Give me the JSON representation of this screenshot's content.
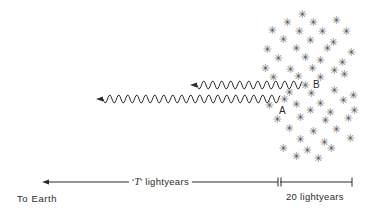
{
  "figure": {
    "type": "physics-diagram",
    "background_color": "#ffffff",
    "ink_color": "#2b2b2b",
    "star_color": "#5a5a5a",
    "width": 378,
    "height": 215
  },
  "labels": {
    "star_a": "A",
    "star_b": "B",
    "to_earth": "To Earth",
    "t_distance_prefix": "‘",
    "t_distance_symbol": "T",
    "t_distance_suffix": "’ lightyears",
    "t_distance_full": "‘T’ lightyears",
    "twenty_lightyears": "20 lightyears"
  },
  "waves": [
    {
      "name": "wave-from-b",
      "label": "B",
      "start_x": 302,
      "end_x": 190,
      "y": 85,
      "amplitude": 4.0,
      "wavelength": 9.0,
      "arrow_direction": "left"
    },
    {
      "name": "wave-from-a",
      "label": "A",
      "start_x": 280,
      "end_x": 96,
      "y": 99,
      "amplitude": 4.0,
      "wavelength": 9.0,
      "arrow_direction": "left"
    }
  ],
  "axis": {
    "name": "distance-scale",
    "y": 182,
    "left_arrow_x": 42,
    "divider_x": 278,
    "right_end_x": 352,
    "segments": [
      {
        "name": "t-segment",
        "label": "‘T’ lightyears",
        "from_x": 42,
        "to_x": 278
      },
      {
        "name": "twenty-segment",
        "label": "20 lightyears",
        "from_x": 280,
        "to_x": 352
      }
    ]
  },
  "point_markers": [
    {
      "name": "star-a-marker",
      "label": "A",
      "star_x": 284,
      "star_y": 99,
      "label_x": 279,
      "label_y": 110
    },
    {
      "name": "star-b-marker",
      "label": "B",
      "star_x": 305,
      "star_y": 85,
      "label_x": 313,
      "label_y": 85
    }
  ],
  "star_field": {
    "count": 52,
    "glyph": "✳",
    "positions": [
      [
        302,
        14
      ],
      [
        287,
        22
      ],
      [
        313,
        22
      ],
      [
        336,
        20
      ],
      [
        272,
        30
      ],
      [
        299,
        31
      ],
      [
        322,
        31
      ],
      [
        346,
        31
      ],
      [
        283,
        39
      ],
      [
        310,
        40
      ],
      [
        333,
        42
      ],
      [
        267,
        49
      ],
      [
        296,
        48
      ],
      [
        327,
        48
      ],
      [
        351,
        52
      ],
      [
        278,
        58
      ],
      [
        305,
        57
      ],
      [
        320,
        60
      ],
      [
        342,
        62
      ],
      [
        265,
        68
      ],
      [
        290,
        69
      ],
      [
        312,
        68
      ],
      [
        334,
        70
      ],
      [
        273,
        77
      ],
      [
        298,
        76
      ],
      [
        320,
        77
      ],
      [
        344,
        74
      ],
      [
        284,
        99
      ],
      [
        305,
        85
      ],
      [
        289,
        92
      ],
      [
        311,
        93
      ],
      [
        334,
        90
      ],
      [
        353,
        95
      ],
      [
        269,
        105
      ],
      [
        296,
        104
      ],
      [
        320,
        103
      ],
      [
        343,
        100
      ],
      [
        310,
        110
      ],
      [
        330,
        112
      ],
      [
        354,
        110
      ],
      [
        277,
        119
      ],
      [
        300,
        117
      ],
      [
        325,
        120
      ],
      [
        348,
        118
      ],
      [
        289,
        128
      ],
      [
        313,
        131
      ],
      [
        336,
        129
      ],
      [
        300,
        139
      ],
      [
        324,
        142
      ],
      [
        350,
        138
      ],
      [
        283,
        148
      ],
      [
        307,
        150
      ],
      [
        331,
        148
      ],
      [
        296,
        156
      ],
      [
        318,
        158
      ]
    ]
  }
}
